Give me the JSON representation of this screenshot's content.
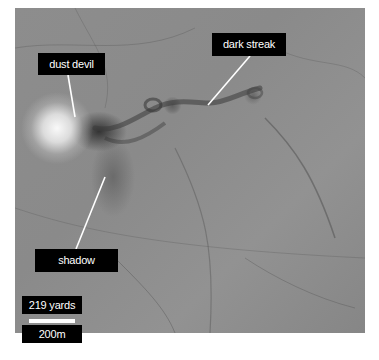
{
  "image": {
    "subject": "dust devil on terrain",
    "background_color": "#8a8a8a"
  },
  "annotations": {
    "dust_devil": "dust devil",
    "dark_streak": "dark streak",
    "shadow": "shadow"
  },
  "scale": {
    "imperial": "219 yards",
    "metric": "200m"
  },
  "colors": {
    "label_bg": "#000000",
    "label_text": "#ffffff",
    "leader_line": "#ffffff"
  }
}
